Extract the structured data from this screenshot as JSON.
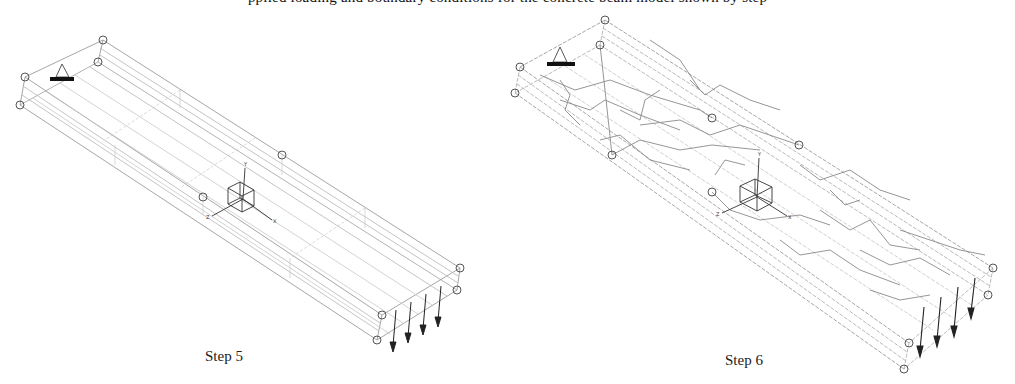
{
  "top_caption_clipped": "pplied loading and boundary conditions for the concrete beam model shown by step",
  "figures": [
    {
      "label": "Step 5",
      "view": "undamaged wireframe beam",
      "support_icon": "triangle-support",
      "load_arrows": 4,
      "axis_labels": [
        "Y",
        "X",
        "Z"
      ]
    },
    {
      "label": "Step 6",
      "view": "cracked wireframe beam",
      "support_icon": "triangle-support",
      "load_arrows": 4,
      "axis_labels": [
        "Y",
        "X",
        "Z"
      ]
    }
  ],
  "colors": {
    "wire": "#9a9a9a",
    "wire_light": "#c8c8c8",
    "crack": "#8a8a8a",
    "node": "#555555",
    "axis": "#333333",
    "support_bar": "#111111"
  }
}
